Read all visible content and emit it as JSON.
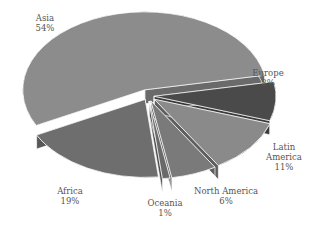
{
  "chart_data": {
    "type": "pie",
    "style": "3d-exploded",
    "title": "",
    "slices": [
      {
        "label": "Asia",
        "value": 54,
        "display": "54%",
        "color": "#8c8c8c",
        "side": "#6a6a6a"
      },
      {
        "label": "Europe",
        "value": 8,
        "display": "8%",
        "color": "#4a4a4a",
        "side": "#3a3a3a"
      },
      {
        "label": "Latin America",
        "value": 11,
        "display": "11%",
        "color": "#8a8a8a",
        "side": "#5e5e5e"
      },
      {
        "label": "North America",
        "value": 6,
        "display": "6%",
        "color": "#7a7a7a",
        "side": "#555555"
      },
      {
        "label": "Oceania",
        "value": 1,
        "display": "1%",
        "color": "#6a6a6a",
        "side": "#4e4e4e"
      },
      {
        "label": "Africa",
        "value": 19,
        "display": "19%",
        "color": "#6e6e6e",
        "side": "#575757"
      }
    ],
    "label_lines": {
      "Asia": [
        "Asia",
        "54%"
      ],
      "Europe": [
        "Europe",
        "8%"
      ],
      "Latin America": [
        "Latin",
        "America",
        "11%"
      ],
      "North America": [
        "North America",
        "6%"
      ],
      "Oceania": [
        "Oceania",
        "1%"
      ],
      "Africa": [
        "Africa",
        "19%"
      ]
    }
  }
}
